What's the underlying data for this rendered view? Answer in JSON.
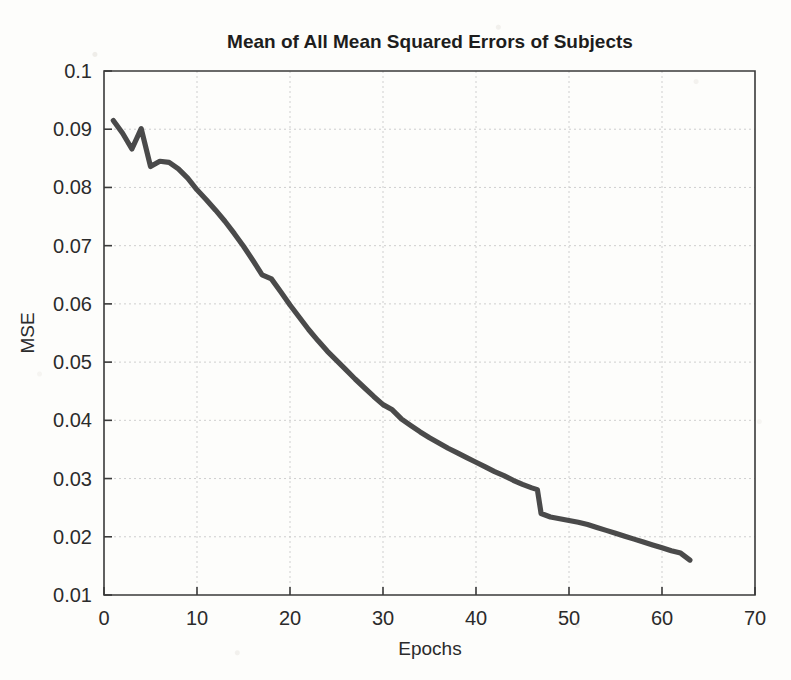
{
  "chart_data": {
    "type": "line",
    "title": "Mean of All Mean Squared Errors of Subjects",
    "xlabel": "Epochs",
    "ylabel": "MSE",
    "xlim": [
      0,
      70
    ],
    "ylim": [
      0.01,
      0.1
    ],
    "xticks": [
      0,
      10,
      20,
      30,
      40,
      50,
      60,
      70
    ],
    "yticks": [
      0.01,
      0.02,
      0.03,
      0.04,
      0.05,
      0.06,
      0.07,
      0.08,
      0.09,
      0.1
    ],
    "xtick_labels": [
      "0",
      "10",
      "20",
      "30",
      "40",
      "50",
      "60",
      "70"
    ],
    "ytick_labels": [
      "0.01",
      "0.02",
      "0.03",
      "0.04",
      "0.05",
      "0.06",
      "0.07",
      "0.08",
      "0.09",
      "0.1"
    ],
    "grid": true,
    "legend": false,
    "line_color": "#4a4a4a",
    "background_color": "#fdfdfb",
    "series": [
      {
        "name": "Mean MSE",
        "x": [
          1,
          2,
          3,
          4,
          5,
          6,
          7,
          8,
          9,
          10,
          11,
          12,
          13,
          14,
          15,
          16,
          17,
          18,
          19,
          20,
          21,
          22,
          23,
          24,
          25,
          26,
          27,
          28,
          29,
          30,
          31,
          32,
          33,
          34,
          35,
          36,
          37,
          38,
          39,
          40,
          41,
          42,
          43,
          44,
          45,
          46,
          46.6,
          47,
          48,
          49,
          50,
          51,
          52,
          53,
          54,
          55,
          56,
          57,
          58,
          59,
          60,
          61,
          62,
          63
        ],
        "values": [
          0.0915,
          0.0893,
          0.0866,
          0.0901,
          0.0836,
          0.0845,
          0.0843,
          0.0832,
          0.0816,
          0.0796,
          0.0779,
          0.0761,
          0.0742,
          0.0721,
          0.0699,
          0.0675,
          0.065,
          0.0643,
          0.0621,
          0.0598,
          0.0577,
          0.0556,
          0.0537,
          0.0519,
          0.0503,
          0.0487,
          0.0471,
          0.0456,
          0.0441,
          0.0427,
          0.0418,
          0.0402,
          0.0391,
          0.038,
          0.037,
          0.0361,
          0.0352,
          0.0344,
          0.0336,
          0.0328,
          0.032,
          0.0312,
          0.0305,
          0.0297,
          0.029,
          0.0284,
          0.0281,
          0.024,
          0.0234,
          0.0231,
          0.0228,
          0.0225,
          0.0221,
          0.0216,
          0.0211,
          0.0206,
          0.0201,
          0.0196,
          0.0191,
          0.0186,
          0.0181,
          0.0176,
          0.0172,
          0.016
        ]
      }
    ],
    "notes": {
      "start_value": "0.0915",
      "end_value": "0.016",
      "end_epoch": "63",
      "step_drop_epoch": "46-47"
    }
  }
}
